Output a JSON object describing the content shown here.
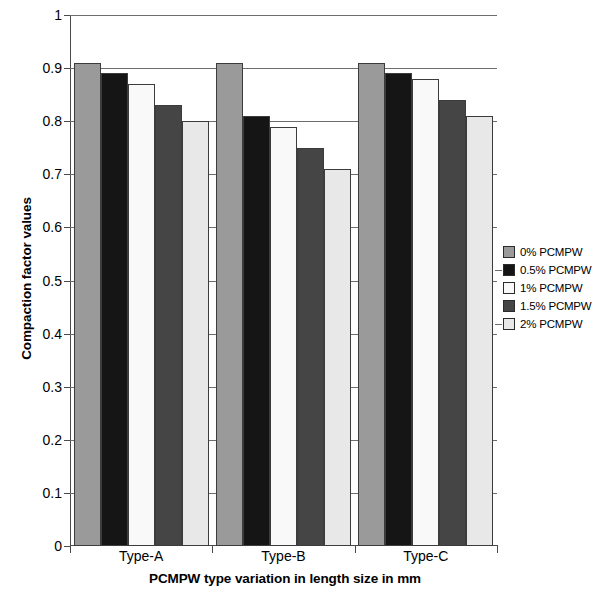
{
  "chart_data": {
    "type": "bar",
    "title": "",
    "xlabel": "PCMPW type variation in length size in mm",
    "ylabel": "Compaction factor values",
    "categories": [
      "Type-A",
      "Type-B",
      "Type-C"
    ],
    "series": [
      {
        "name": "0% PCMPW",
        "color": "#9a9a9a",
        "values": [
          0.91,
          0.91,
          0.91
        ]
      },
      {
        "name": "0.5% PCMPW",
        "color": "#151515",
        "values": [
          0.89,
          0.81,
          0.89
        ]
      },
      {
        "name": "1% PCMPW",
        "color": "#f9f9f9",
        "values": [
          0.87,
          0.79,
          0.88
        ]
      },
      {
        "name": "1.5% PCMPW",
        "color": "#454545",
        "values": [
          0.83,
          0.75,
          0.84
        ]
      },
      {
        "name": "2% PCMPW",
        "color": "#e8e8e8",
        "values": [
          0.8,
          0.71,
          0.81
        ]
      }
    ],
    "ylim": [
      0,
      1
    ],
    "yticks": [
      "0",
      "0.1",
      "0.2",
      "0.3",
      "0.4",
      "0.5",
      "0.6",
      "0.7",
      "0.8",
      "0.9",
      "1"
    ],
    "ytick_values": [
      0,
      0.1,
      0.2,
      0.3,
      0.4,
      0.5,
      0.6,
      0.7,
      0.8,
      0.9,
      1
    ],
    "grid": true,
    "legend_position": "right"
  },
  "axes": {
    "y_title": "Compaction factor values",
    "x_title": "PCMPW type variation in length size in mm"
  },
  "legend": {
    "items": [
      {
        "label": "0% PCMPW",
        "color": "#9a9a9a"
      },
      {
        "label": "0.5% PCMPW",
        "color": "#151515"
      },
      {
        "label": "1% PCMPW",
        "color": "#f9f9f9"
      },
      {
        "label": "1.5% PCMPW",
        "color": "#454545"
      },
      {
        "label": "2% PCMPW",
        "color": "#e8e8e8"
      }
    ]
  }
}
